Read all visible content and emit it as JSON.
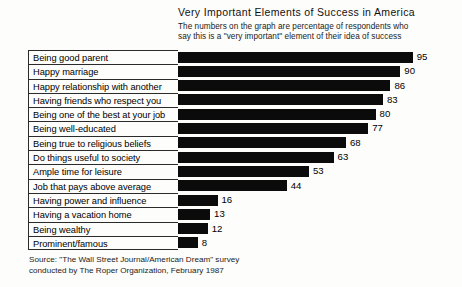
{
  "chart_data": {
    "type": "bar",
    "orientation": "horizontal",
    "title": "Very Important Elements of Success in America",
    "subtitle_lines": [
      "The numbers on the graph are percentage of respondents who",
      "say this is a \"very important\" element of their idea of success"
    ],
    "xlabel": "",
    "ylabel": "",
    "xlim": [
      0,
      100
    ],
    "grid": false,
    "legend": null,
    "bar_color": "#0b0b0b",
    "categories": [
      "Being good parent",
      "Happy marriage",
      "Happy relationship with another",
      "Having friends who respect you",
      "Being one of the best at your job",
      "Being well-educated",
      "Being true to religious beliefs",
      "Do things useful to society",
      "Ample time for leisure",
      "Job that pays above average",
      "Having power and influence",
      "Having a vacation home",
      "Being wealthy",
      "Prominent/famous"
    ],
    "values": [
      95,
      90,
      86,
      83,
      80,
      77,
      68,
      63,
      53,
      44,
      16,
      13,
      12,
      8
    ],
    "value_labels": [
      "95",
      "90",
      "86",
      "83",
      "80",
      "77",
      "68",
      "63",
      "53",
      "44",
      "16",
      "13",
      "12",
      "8"
    ]
  },
  "rows": [
    {
      "label": "Being good parent",
      "value": 95,
      "value_label": "95"
    },
    {
      "label": "Happy marriage",
      "value": 90,
      "value_label": "90"
    },
    {
      "label": "Happy relationship with another",
      "value": 86,
      "value_label": "86"
    },
    {
      "label": "Having friends who respect you",
      "value": 83,
      "value_label": "83"
    },
    {
      "label": "Being one of the best at your job",
      "value": 80,
      "value_label": "80"
    },
    {
      "label": "Being well-educated",
      "value": 77,
      "value_label": "77"
    },
    {
      "label": "Being true to religious beliefs",
      "value": 68,
      "value_label": "68"
    },
    {
      "label": "Do things useful to society",
      "value": 63,
      "value_label": "63"
    },
    {
      "label": "Ample time for leisure",
      "value": 53,
      "value_label": "53"
    },
    {
      "label": "Job that pays above average",
      "value": 44,
      "value_label": "44"
    },
    {
      "label": "Having power and influence",
      "value": 16,
      "value_label": "16"
    },
    {
      "label": "Having a vacation home",
      "value": 13,
      "value_label": "13"
    },
    {
      "label": "Being wealthy",
      "value": 12,
      "value_label": "12"
    },
    {
      "label": "Prominent/famous",
      "value": 8,
      "value_label": "8"
    }
  ],
  "header": {
    "title": "Very Important Elements of Success in America",
    "subtitle_line_1": "The numbers on the graph are percentage of respondents who",
    "subtitle_line_2": "say this is a \"very important\" element of their idea of success"
  },
  "source": {
    "line_1": "Source: \"The Wall Street Journal/American Dream\" survey",
    "line_2": "conducted by The Roper Organization, February 1987"
  }
}
